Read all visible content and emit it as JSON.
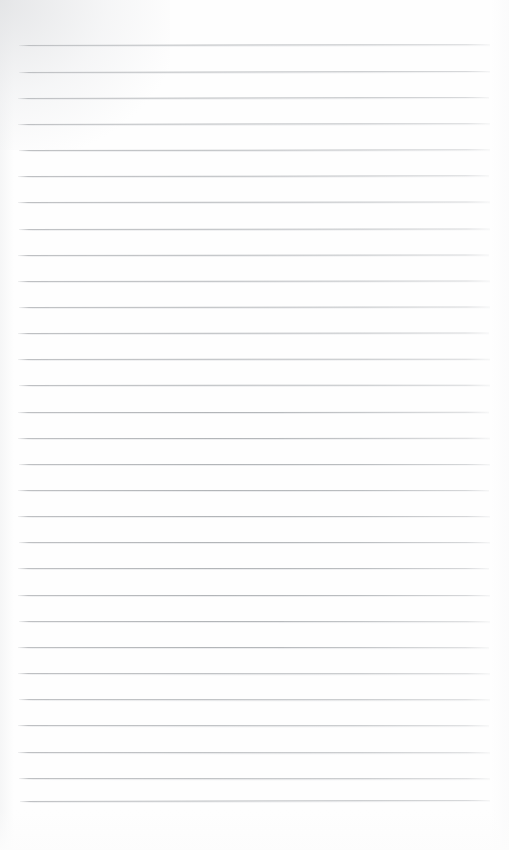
{
  "document": {
    "kind": "ruled-notepad-page",
    "title": "Ruled Notepad Page",
    "orientation": "portrait",
    "page_width_px": 509,
    "page_height_px": 850,
    "text_content": "",
    "has_handwriting": false,
    "has_printed_text": false,
    "is_blank": true
  },
  "colors": {
    "page_background": "#fefefe",
    "rule_line": "#b4b7ba",
    "rule_line_faded": "#c9cbcd",
    "scan_tint": "#e9eaec"
  },
  "ruling": {
    "line_count": 30,
    "first_line_y": 45,
    "line_spacing_px": 26.1,
    "line_thickness_px": 1,
    "left_margin_px": 18,
    "right_margin_px": 19,
    "line_left_x": 18,
    "line_right_x": 490,
    "line_length_px": 472,
    "top_blank_space_px": 45,
    "bottom_blank_space_px": 49,
    "has_vertical_margin_rule": false,
    "has_header_rule": false,
    "lines": [
      {
        "index": 1,
        "y_left": 45.4,
        "y_right": 44.6,
        "x_start": 19,
        "x_end": 490,
        "tilt_deg": -0.1
      },
      {
        "index": 2,
        "y_left": 71.6,
        "y_right": 70.6,
        "x_start": 19,
        "x_end": 490,
        "tilt_deg": -0.12
      },
      {
        "index": 3,
        "y_left": 97.7,
        "y_right": 96.8,
        "x_start": 18,
        "x_end": 489,
        "tilt_deg": -0.11
      },
      {
        "index": 4,
        "y_left": 123.9,
        "y_right": 123.1,
        "x_start": 18,
        "x_end": 490,
        "tilt_deg": -0.1
      },
      {
        "index": 5,
        "y_left": 150.0,
        "y_right": 149.3,
        "x_start": 19,
        "x_end": 490,
        "tilt_deg": -0.09
      },
      {
        "index": 6,
        "y_left": 176.2,
        "y_right": 175.5,
        "x_start": 18,
        "x_end": 489,
        "tilt_deg": -0.09
      },
      {
        "index": 7,
        "y_left": 202.3,
        "y_right": 201.7,
        "x_start": 18,
        "x_end": 490,
        "tilt_deg": -0.07
      },
      {
        "index": 8,
        "y_left": 228.5,
        "y_right": 227.9,
        "x_start": 19,
        "x_end": 490,
        "tilt_deg": -0.07
      },
      {
        "index": 9,
        "y_left": 254.6,
        "y_right": 254.1,
        "x_start": 18,
        "x_end": 489,
        "tilt_deg": -0.06
      },
      {
        "index": 10,
        "y_left": 280.8,
        "y_right": 280.3,
        "x_start": 18,
        "x_end": 490,
        "tilt_deg": -0.06
      },
      {
        "index": 11,
        "y_left": 306.9,
        "y_right": 306.5,
        "x_start": 19,
        "x_end": 490,
        "tilt_deg": -0.05
      },
      {
        "index": 12,
        "y_left": 333.1,
        "y_right": 332.7,
        "x_start": 18,
        "x_end": 489,
        "tilt_deg": -0.05
      },
      {
        "index": 13,
        "y_left": 359.2,
        "y_right": 358.9,
        "x_start": 18,
        "x_end": 490,
        "tilt_deg": -0.04
      },
      {
        "index": 14,
        "y_left": 385.4,
        "y_right": 385.1,
        "x_start": 19,
        "x_end": 490,
        "tilt_deg": -0.04
      },
      {
        "index": 15,
        "y_left": 411.5,
        "y_right": 411.3,
        "x_start": 18,
        "x_end": 489,
        "tilt_deg": -0.03
      },
      {
        "index": 16,
        "y_left": 437.7,
        "y_right": 437.5,
        "x_start": 18,
        "x_end": 490,
        "tilt_deg": -0.03
      },
      {
        "index": 17,
        "y_left": 463.8,
        "y_right": 463.7,
        "x_start": 19,
        "x_end": 490,
        "tilt_deg": -0.02
      },
      {
        "index": 18,
        "y_left": 490.0,
        "y_right": 489.9,
        "x_start": 18,
        "x_end": 489,
        "tilt_deg": -0.02
      },
      {
        "index": 19,
        "y_left": 516.1,
        "y_right": 516.1,
        "x_start": 18,
        "x_end": 490,
        "tilt_deg": 0.0
      },
      {
        "index": 20,
        "y_left": 542.3,
        "y_right": 542.3,
        "x_start": 19,
        "x_end": 490,
        "tilt_deg": 0.0
      },
      {
        "index": 21,
        "y_left": 568.4,
        "y_right": 568.5,
        "x_start": 18,
        "x_end": 489,
        "tilt_deg": 0.01
      },
      {
        "index": 22,
        "y_left": 594.6,
        "y_right": 594.7,
        "x_start": 18,
        "x_end": 490,
        "tilt_deg": 0.01
      },
      {
        "index": 23,
        "y_left": 620.7,
        "y_right": 620.9,
        "x_start": 19,
        "x_end": 490,
        "tilt_deg": 0.02
      },
      {
        "index": 24,
        "y_left": 646.9,
        "y_right": 647.1,
        "x_start": 18,
        "x_end": 489,
        "tilt_deg": 0.02
      },
      {
        "index": 25,
        "y_left": 673.0,
        "y_right": 673.3,
        "x_start": 18,
        "x_end": 490,
        "tilt_deg": 0.03
      },
      {
        "index": 26,
        "y_left": 699.2,
        "y_right": 699.5,
        "x_start": 19,
        "x_end": 490,
        "tilt_deg": 0.03
      },
      {
        "index": 27,
        "y_left": 725.3,
        "y_right": 725.6,
        "x_start": 18,
        "x_end": 489,
        "tilt_deg": 0.04
      },
      {
        "index": 28,
        "y_left": 751.5,
        "y_right": 751.8,
        "x_start": 18,
        "x_end": 490,
        "tilt_deg": 0.04
      },
      {
        "index": 29,
        "y_left": 777.6,
        "y_right": 777.9,
        "x_start": 19,
        "x_end": 490,
        "tilt_deg": 0.04
      },
      {
        "index": 30,
        "y_left": 800.6,
        "y_right": 799.6,
        "x_start": 20,
        "x_end": 490,
        "tilt_deg": -0.12
      }
    ]
  }
}
